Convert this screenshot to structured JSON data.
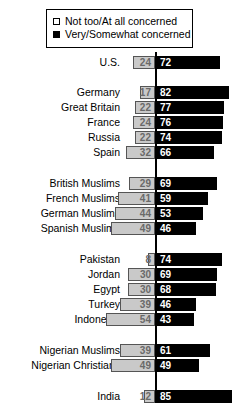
{
  "legend": {
    "items": [
      {
        "label": "Not too/At all concerned",
        "swatch": "open-square-icon",
        "color": "#c9c9c9"
      },
      {
        "label": "Very/Somewhat concerned",
        "swatch": "filled-square-icon",
        "color": "#000000"
      }
    ]
  },
  "chart_data": {
    "type": "bar",
    "orientation": "horizontal-diverging",
    "title": "",
    "xlabel": "",
    "ylabel": "",
    "xlim": [
      0,
      100
    ],
    "grid": false,
    "legend_position": "top",
    "center_axis": true,
    "series": [
      {
        "name": "Not too/At all concerned",
        "color": "#c9c9c9",
        "direction": "left",
        "values": [
          24,
          17,
          22,
          24,
          22,
          32,
          29,
          41,
          44,
          49,
          8,
          30,
          30,
          39,
          54,
          39,
          49,
          12
        ]
      },
      {
        "name": "Very/Somewhat concerned",
        "color": "#000000",
        "direction": "right",
        "values": [
          72,
          82,
          77,
          76,
          74,
          66,
          69,
          59,
          53,
          46,
          74,
          69,
          68,
          46,
          43,
          61,
          49,
          85
        ]
      }
    ],
    "categories": [
      "U.S.",
      "Germany",
      "Great Britain",
      "France",
      "Russia",
      "Spain",
      "British Muslims",
      "French Muslims",
      "German Muslims",
      "Spanish Muslims",
      "Pakistan",
      "Jordan",
      "Egypt",
      "Turkey",
      "Indonesia",
      "Nigerian Muslims",
      "Nigerian Christians",
      "India"
    ],
    "groups": [
      {
        "name": "western",
        "categories": [
          "U.S."
        ]
      },
      {
        "name": "europe",
        "categories": [
          "Germany",
          "Great Britain",
          "France",
          "Russia",
          "Spain"
        ]
      },
      {
        "name": "european-muslims",
        "categories": [
          "British Muslims",
          "French Muslims",
          "German Muslims",
          "Spanish Muslims"
        ]
      },
      {
        "name": "muslim-majority",
        "categories": [
          "Pakistan",
          "Jordan",
          "Egypt",
          "Turkey",
          "Indonesia"
        ]
      },
      {
        "name": "nigeria",
        "categories": [
          "Nigerian Muslims",
          "Nigerian Christians"
        ]
      },
      {
        "name": "india",
        "categories": [
          "India"
        ]
      }
    ],
    "rows": [
      {
        "label": "U.S.",
        "left": 24,
        "right": 72,
        "y": 3
      },
      {
        "label": "Germany",
        "left": 17,
        "right": 82,
        "y": 33
      },
      {
        "label": "Great Britain",
        "left": 22,
        "right": 77,
        "y": 48
      },
      {
        "label": "France",
        "left": 24,
        "right": 76,
        "y": 63
      },
      {
        "label": "Russia",
        "left": 22,
        "right": 74,
        "y": 78
      },
      {
        "label": "Spain",
        "left": 32,
        "right": 66,
        "y": 93
      },
      {
        "label": "British Muslims",
        "left": 29,
        "right": 69,
        "y": 124
      },
      {
        "label": "French Muslims",
        "left": 41,
        "right": 59,
        "y": 139
      },
      {
        "label": "German Muslims",
        "left": 44,
        "right": 53,
        "y": 154
      },
      {
        "label": "Spanish Muslims",
        "left": 49,
        "right": 46,
        "y": 169
      },
      {
        "label": "Pakistan",
        "left": 8,
        "right": 74,
        "y": 200
      },
      {
        "label": "Jordan",
        "left": 30,
        "right": 69,
        "y": 215
      },
      {
        "label": "Egypt",
        "left": 30,
        "right": 68,
        "y": 230
      },
      {
        "label": "Turkey",
        "left": 39,
        "right": 46,
        "y": 245
      },
      {
        "label": "Indonesia",
        "left": 54,
        "right": 43,
        "y": 260
      },
      {
        "label": "Nigerian Muslims",
        "left": 39,
        "right": 61,
        "y": 291
      },
      {
        "label": "Nigerian Christians",
        "left": 49,
        "right": 49,
        "y": 306
      },
      {
        "label": "India",
        "left": 12,
        "right": 85,
        "y": 337
      }
    ]
  }
}
